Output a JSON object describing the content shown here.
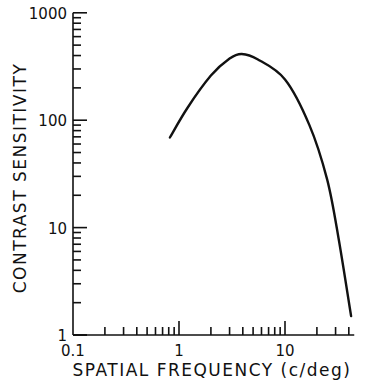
{
  "chart_data": {
    "type": "line",
    "title": "",
    "xlabel": "SPATIAL FREQUENCY (c/deg)",
    "ylabel": "CONTRAST SENSITIVITY",
    "xscale": "log",
    "yscale": "log",
    "xlim": [
      0.1,
      50
    ],
    "ylim": [
      1,
      1000
    ],
    "x_tick_labels": [
      "0.1",
      "1",
      "10"
    ],
    "y_tick_labels": [
      "1",
      "10",
      "100",
      "1000"
    ],
    "grid": false,
    "legend": null,
    "series": [
      {
        "name": "contrast sensitivity function",
        "x": [
          0.82,
          1.2,
          2.0,
          3.0,
          3.9,
          5.5,
          10,
          17,
          25,
          32,
          42
        ],
        "y": [
          69,
          130,
          260,
          375,
          413,
          370,
          240,
          90,
          28,
          8,
          1.5
        ]
      }
    ]
  }
}
